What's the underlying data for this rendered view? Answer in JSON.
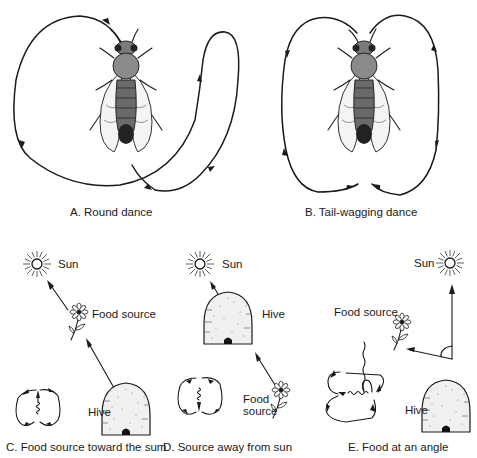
{
  "figure": {
    "panels": [
      {
        "id": "A",
        "caption": "A. Round dance"
      },
      {
        "id": "B",
        "caption": "B. Tail-wagging dance"
      },
      {
        "id": "C",
        "caption": "C. Food source toward the sum",
        "labels": {
          "sun": "Sun",
          "food": "Food source",
          "hive": "Hive"
        }
      },
      {
        "id": "D",
        "caption": "D. Source away from sun",
        "labels": {
          "sun": "Sun",
          "hive": "Hive",
          "food_line1": "Food",
          "food_line2": "source"
        }
      },
      {
        "id": "E",
        "caption": "E. Food at an angle",
        "labels": {
          "sun": "Sun",
          "food": "Food source",
          "hive": "Hive"
        }
      }
    ],
    "icons": [
      "bee-icon",
      "sun-icon",
      "flower-icon",
      "hive-icon",
      "dance-path-icon"
    ],
    "colors": {
      "ink": "#1a1a1a",
      "background": "#ffffff"
    }
  }
}
